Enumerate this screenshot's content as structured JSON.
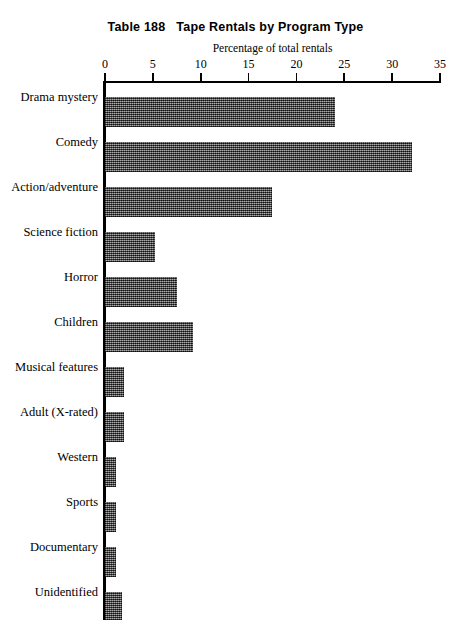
{
  "chart_data": {
    "type": "bar",
    "orientation": "horizontal",
    "title": "Table 188   Tape Rentals by Program Type",
    "subtitle": "",
    "xlabel": "Percentage of total rentals",
    "ylabel": "",
    "xlim": [
      0,
      35
    ],
    "xticks": [
      0,
      5,
      10,
      15,
      20,
      25,
      30,
      35
    ],
    "grid": false,
    "legend": false,
    "bar_color": "#5b5b5b",
    "categories": [
      "Drama mystery",
      "Comedy",
      "Action/adventure",
      "Science fiction",
      "Horror",
      "Children",
      "Musical features",
      "Adult (X-rated)",
      "Western",
      "Sports",
      "Documentary",
      "Unidentified"
    ],
    "values": [
      24.0,
      32.1,
      17.4,
      5.2,
      7.5,
      9.2,
      2.0,
      2.0,
      1.2,
      1.2,
      1.2,
      1.8
    ],
    "series": [
      {
        "name": "Percentage of total rentals",
        "values": [
          24.0,
          32.1,
          17.4,
          5.2,
          7.5,
          9.2,
          2.0,
          2.0,
          1.2,
          1.2,
          1.2,
          1.8
        ]
      }
    ],
    "bars": [
      {
        "label": "Drama mystery",
        "value": 24.0
      },
      {
        "label": "Comedy",
        "value": 32.1
      },
      {
        "label": "Action/adventure",
        "value": 17.4
      },
      {
        "label": "Science fiction",
        "value": 5.2
      },
      {
        "label": "Horror",
        "value": 7.5
      },
      {
        "label": "Children",
        "value": 9.2
      },
      {
        "label": "Musical features",
        "value": 2.0
      },
      {
        "label": "Adult (X-rated)",
        "value": 2.0
      },
      {
        "label": "Western",
        "value": 1.2
      },
      {
        "label": "Sports",
        "value": 1.2
      },
      {
        "label": "Documentary",
        "value": 1.2
      },
      {
        "label": "Unidentified",
        "value": 1.8
      }
    ]
  }
}
